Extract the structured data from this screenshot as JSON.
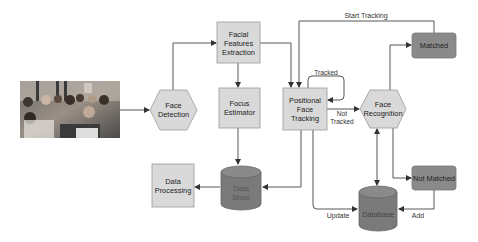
{
  "diagram": {
    "type": "flowchart",
    "colors": {
      "box_fill": "#d9d9d9",
      "box_stroke": "#999999",
      "dark_fill": "#8a8a8a",
      "cylinder_fill": "#7a7a7a",
      "line": "#444444"
    },
    "nodes": {
      "photo": {
        "label": "Classroom photo",
        "shape": "image"
      },
      "face_detection": {
        "line1": "Face",
        "line2": "Detection",
        "shape": "hexagon"
      },
      "facial_features": {
        "line1": "Facial",
        "line2": "Features",
        "line3": "Extraction",
        "shape": "rectangle"
      },
      "focus_estimator": {
        "line1": "Focus",
        "line2": "Estimator",
        "shape": "rectangle"
      },
      "data_processing": {
        "line1": "Data",
        "line2": "Processing",
        "shape": "rectangle"
      },
      "data_store": {
        "line1": "Data",
        "line2": "Store",
        "shape": "cylinder"
      },
      "positional_tracking": {
        "line1": "Positional",
        "line2": "Face",
        "line3": "Tracking",
        "shape": "rectangle"
      },
      "face_recognition": {
        "line1": "Face",
        "line2": "Recognition",
        "shape": "hexagon"
      },
      "matched": {
        "label": "Matched",
        "shape": "rounded-rectangle"
      },
      "not_matched": {
        "label": "Not Matched",
        "shape": "rounded-rectangle"
      },
      "database": {
        "label": "Database",
        "shape": "cylinder"
      }
    },
    "edges": {
      "start_tracking": "Start Tracking",
      "tracked": "Tracked",
      "not_tracked_1": "Not",
      "not_tracked_2": "Tracked",
      "update": "Update",
      "add": "Add"
    }
  }
}
